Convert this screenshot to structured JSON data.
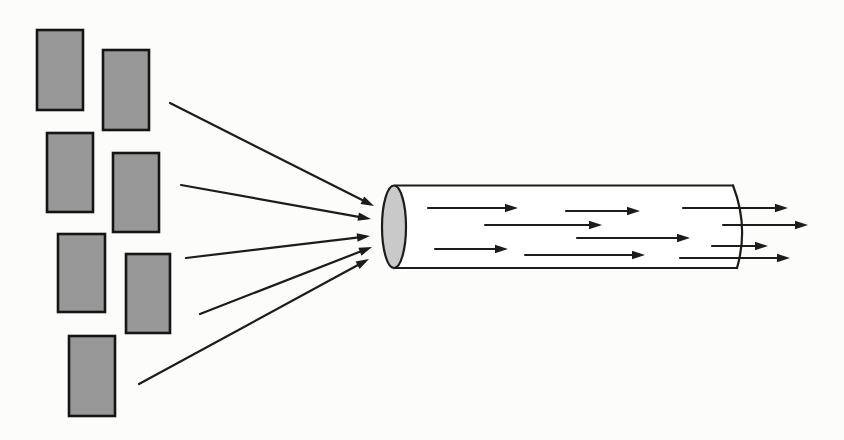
{
  "colors": {
    "background": "#fcfcfb",
    "rect_fill": "#989898",
    "rect_border": "#151515",
    "line": "#1c1c1c",
    "tube_fill": "#ffffff",
    "tube_outline": "#1c1c1c",
    "inlet_fill": "#c9c9c9"
  },
  "diagram": {
    "canvas": {
      "width": 844,
      "height": 440
    },
    "stroke": {
      "line": 2.2,
      "rect_border": 2.6,
      "tube_outline": 2.2
    },
    "arrow_head": {
      "length": 13,
      "half_width": 4.2
    },
    "rectangles": [
      {
        "x": 37,
        "y": 30,
        "w": 46,
        "h": 80
      },
      {
        "x": 103,
        "y": 50,
        "w": 46,
        "h": 80
      },
      {
        "x": 47,
        "y": 133,
        "w": 46,
        "h": 79
      },
      {
        "x": 113,
        "y": 153,
        "w": 46,
        "h": 79
      },
      {
        "x": 58,
        "y": 234,
        "w": 47,
        "h": 78
      },
      {
        "x": 126,
        "y": 254,
        "w": 44,
        "h": 79
      },
      {
        "x": 69,
        "y": 336,
        "w": 46,
        "h": 80
      }
    ],
    "converging_arrows": [
      {
        "x1": 170,
        "y1": 103,
        "x2": 374,
        "y2": 206
      },
      {
        "x1": 181,
        "y1": 185,
        "x2": 371,
        "y2": 219
      },
      {
        "x1": 186,
        "y1": 258,
        "x2": 370,
        "y2": 236
      },
      {
        "x1": 200,
        "y1": 314,
        "x2": 372,
        "y2": 247
      },
      {
        "x1": 139,
        "y1": 384,
        "x2": 369,
        "y2": 259
      }
    ],
    "tube": {
      "body_path": "M 395 185.5 L 733 185.5 Q 749 226.8 737 268 L 395 268 Z",
      "top_line": {
        "x1": 395,
        "y1": 185.5,
        "x2": 733,
        "y2": 185.5
      },
      "bottom_line": {
        "x1": 395,
        "y1": 268,
        "x2": 737,
        "y2": 268
      },
      "outlet_arc_path": "M 733 185.5 Q 749 226.8 737 268",
      "inlet_ellipse": {
        "cx": 394,
        "cy": 226.8,
        "rx": 12,
        "ry": 41.3
      }
    },
    "flow_arrows": [
      {
        "x1": 428,
        "y1": 208,
        "x2": 518,
        "y2": 208
      },
      {
        "x1": 566,
        "y1": 211,
        "x2": 640,
        "y2": 211
      },
      {
        "x1": 683,
        "y1": 208,
        "x2": 788,
        "y2": 208
      },
      {
        "x1": 485,
        "y1": 225,
        "x2": 602,
        "y2": 225
      },
      {
        "x1": 723,
        "y1": 225,
        "x2": 808,
        "y2": 225
      },
      {
        "x1": 577,
        "y1": 238,
        "x2": 690,
        "y2": 238
      },
      {
        "x1": 712,
        "y1": 246,
        "x2": 768,
        "y2": 246
      },
      {
        "x1": 435,
        "y1": 249,
        "x2": 508,
        "y2": 249
      },
      {
        "x1": 525,
        "y1": 255,
        "x2": 645,
        "y2": 255
      },
      {
        "x1": 680,
        "y1": 258,
        "x2": 790,
        "y2": 258
      }
    ]
  }
}
